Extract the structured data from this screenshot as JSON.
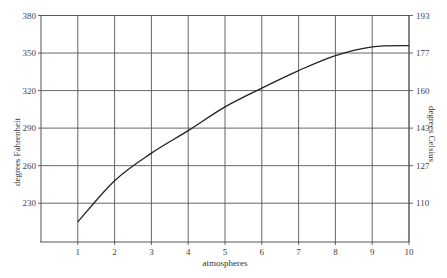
{
  "chart_data": {
    "type": "line",
    "title": "",
    "xlabel": "atmospheres",
    "ylabel": "degrees Fahrenheit",
    "ylabel_right": "degrees Celsius",
    "x": [
      1,
      2,
      3,
      4,
      5,
      6,
      7,
      8,
      9,
      10
    ],
    "series": [
      {
        "name": "boiling point of water",
        "values": [
          215,
          248,
          270,
          288,
          307,
          322,
          336,
          348,
          355,
          356
        ]
      }
    ],
    "xlim": [
      0,
      10
    ],
    "ylim": [
      199,
      380
    ],
    "x_ticks": [
      1,
      2,
      3,
      4,
      5,
      6,
      7,
      8,
      9,
      10
    ],
    "y_ticks_left": [
      230,
      260,
      290,
      320,
      350,
      380
    ],
    "y_ticks_right": [
      {
        "label": "110",
        "at_f": 230
      },
      {
        "label": "127",
        "at_f": 260
      },
      {
        "label": "143",
        "at_f": 290
      },
      {
        "label": "160",
        "at_f": 320
      },
      {
        "label": "177",
        "at_f": 350
      },
      {
        "label": "193",
        "at_f": 380
      }
    ],
    "grid": true,
    "legend": "none",
    "colors": {
      "line": "#222222",
      "grid": "#555555",
      "frame": "#555555",
      "text": "#444444"
    }
  }
}
